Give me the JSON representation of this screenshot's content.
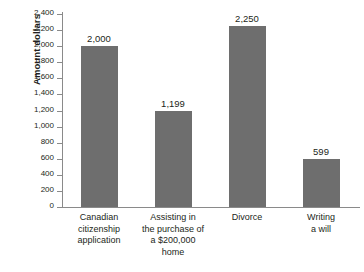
{
  "chart_data": {
    "type": "bar",
    "title": "",
    "xlabel": "",
    "ylabel": "Amount dollars",
    "ylim": [
      0,
      2400
    ],
    "ytick_step": 200,
    "grid": false,
    "legend": "none",
    "bar_color": "#6e6e6e",
    "axis_color": "#8a8a8a",
    "categories": [
      "Canadian citizenship application",
      "Assisting in the purchase of a $200,000 home",
      "Divorce",
      "Writing a will"
    ],
    "category_lines": [
      [
        "Canadian",
        "citizenship",
        "application"
      ],
      [
        "Assisting in",
        "the purchase of",
        "a $200,000",
        "home"
      ],
      [
        "Divorce"
      ],
      [
        "Writing",
        "a will"
      ]
    ],
    "values": [
      2000,
      1199,
      2250,
      599
    ],
    "value_labels": [
      "2,000",
      "1,199",
      "2,250",
      "599"
    ],
    "ytick_labels": [
      "0",
      "200",
      "400",
      "600",
      "800",
      "1,000",
      "1,200",
      "1,400",
      "1,600",
      "1,800",
      "2,000",
      "2,200",
      "2,400"
    ],
    "ytick_values": [
      0,
      200,
      400,
      600,
      800,
      1000,
      1200,
      1400,
      1600,
      1800,
      2000,
      2200,
      2400
    ]
  }
}
